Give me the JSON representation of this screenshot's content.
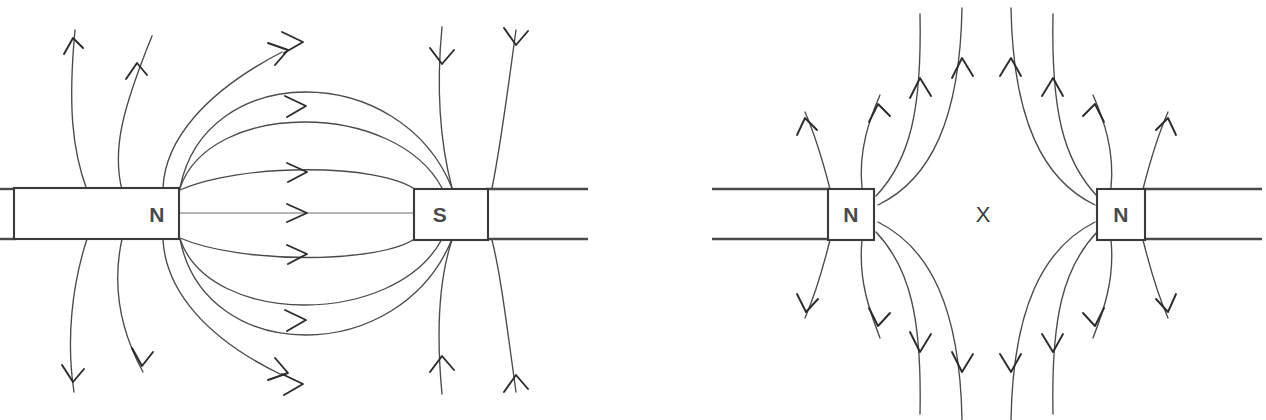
{
  "figure": {
    "type": "physics-diagram",
    "width": 1266,
    "height": 420,
    "background_color": "#ffffff",
    "line_color": "#4a4a4a",
    "label_color": "#4a4a4a"
  },
  "panels": [
    {
      "id": "attraction",
      "name": "unlike-poles-attract",
      "description": "Field lines run from the N pole of the left magnet into the S pole of the right magnet.",
      "magnets": [
        {
          "id": "left-magnet",
          "pole_label": "N",
          "pole_label_x": 157,
          "pole_label_y": 213,
          "rect": {
            "x": 14,
            "y": 188,
            "width": 165,
            "height": 51
          },
          "tail_direction": "left",
          "tail_x_start": -6,
          "tail_x_end": 14
        },
        {
          "id": "right-magnet",
          "pole_label": "S",
          "pole_label_x": 440,
          "pole_label_y": 213,
          "rect": {
            "x": 414,
            "y": 189,
            "width": 74,
            "height": 51
          },
          "tail_direction": "right",
          "tail_x_start": 488,
          "tail_x_end": 586
        }
      ],
      "neutral_point": null,
      "field_line_count": 18,
      "arrow_direction_summary": "N to S, rightward through the gap, returning above and below"
    },
    {
      "id": "repulsion",
      "name": "like-poles-repel",
      "description": "Two facing N poles; field lines curve away from each other leaving a neutral point between them.",
      "magnets": [
        {
          "id": "left-magnet",
          "pole_label": "N",
          "pole_label_x": 851,
          "pole_label_y": 213,
          "rect": {
            "x": 828,
            "y": 189,
            "width": 46,
            "height": 51
          },
          "tail_direction": "left",
          "tail_x_start": 712,
          "tail_x_end": 828
        },
        {
          "id": "right-magnet",
          "pole_label": "N",
          "pole_label_x": 1121,
          "pole_label_y": 213,
          "rect": {
            "x": 1097,
            "y": 189,
            "width": 48,
            "height": 51
          },
          "tail_direction": "right",
          "tail_x_start": 1145,
          "tail_x_end": 1262
        }
      ],
      "neutral_point": {
        "label": "X",
        "x": 983,
        "y": 213,
        "meaning": "neutral-point"
      },
      "field_line_count": 20,
      "arrow_direction_summary": "Away from both N poles; lines sweep up and down through the gap and never join"
    }
  ]
}
